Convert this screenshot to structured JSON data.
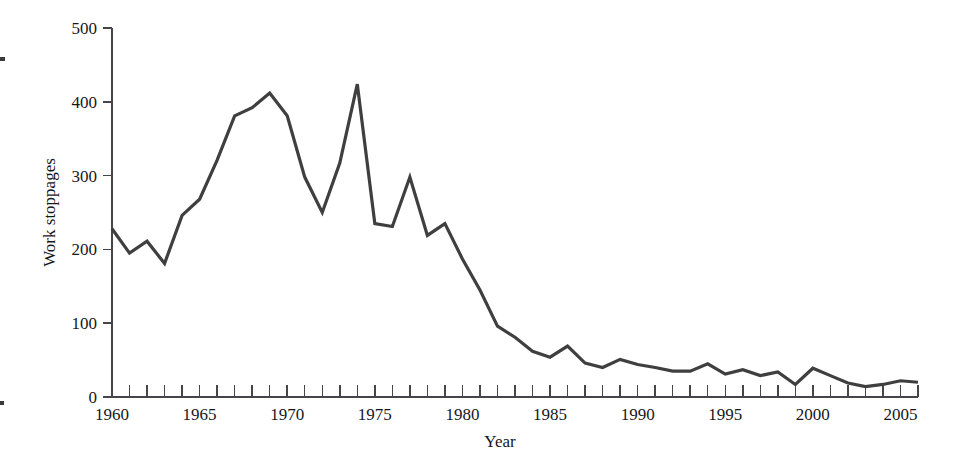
{
  "chart_data": {
    "type": "line",
    "title": "",
    "xlabel": "Year",
    "ylabel": "Work stoppages",
    "xlim": [
      1960,
      2006
    ],
    "ylim": [
      0,
      500
    ],
    "grid": false,
    "legend": "none",
    "line_color": "#3f3f3f",
    "line_width": 3.2,
    "x_tick_interval": 1,
    "x_label_interval": 5,
    "y_tick_interval": 100,
    "xticklabels": [
      "1960",
      "1965",
      "1970",
      "1975",
      "1980",
      "1985",
      "1990",
      "1995",
      "2000",
      "2005"
    ],
    "yticklabels": [
      "0",
      "100",
      "200",
      "300",
      "400",
      "500"
    ],
    "x": [
      1960,
      1961,
      1962,
      1963,
      1964,
      1965,
      1966,
      1967,
      1968,
      1969,
      1970,
      1971,
      1972,
      1973,
      1974,
      1975,
      1976,
      1977,
      1978,
      1979,
      1980,
      1981,
      1982,
      1983,
      1984,
      1985,
      1986,
      1987,
      1988,
      1989,
      1990,
      1991,
      1992,
      1993,
      1994,
      1995,
      1996,
      1997,
      1998,
      1999,
      2000,
      2001,
      2002,
      2003,
      2004,
      2005,
      2006
    ],
    "values": [
      228,
      195,
      211,
      181,
      246,
      268,
      321,
      381,
      392,
      412,
      381,
      298,
      250,
      317,
      424,
      235,
      231,
      298,
      219,
      235,
      187,
      145,
      96,
      81,
      62,
      54,
      69,
      46,
      40,
      51,
      44,
      40,
      35,
      35,
      45,
      31,
      37,
      29,
      34,
      17,
      39,
      29,
      19,
      14,
      17,
      22,
      20
    ],
    "series": [
      {
        "name": "Work stoppages",
        "values": [
          228,
          195,
          211,
          181,
          246,
          268,
          321,
          381,
          392,
          412,
          381,
          298,
          250,
          317,
          424,
          235,
          231,
          298,
          219,
          235,
          187,
          145,
          96,
          81,
          62,
          54,
          69,
          46,
          40,
          51,
          44,
          40,
          35,
          35,
          45,
          31,
          37,
          29,
          34,
          17,
          39,
          29,
          19,
          14,
          17,
          22,
          20
        ]
      }
    ],
    "annotations": []
  }
}
